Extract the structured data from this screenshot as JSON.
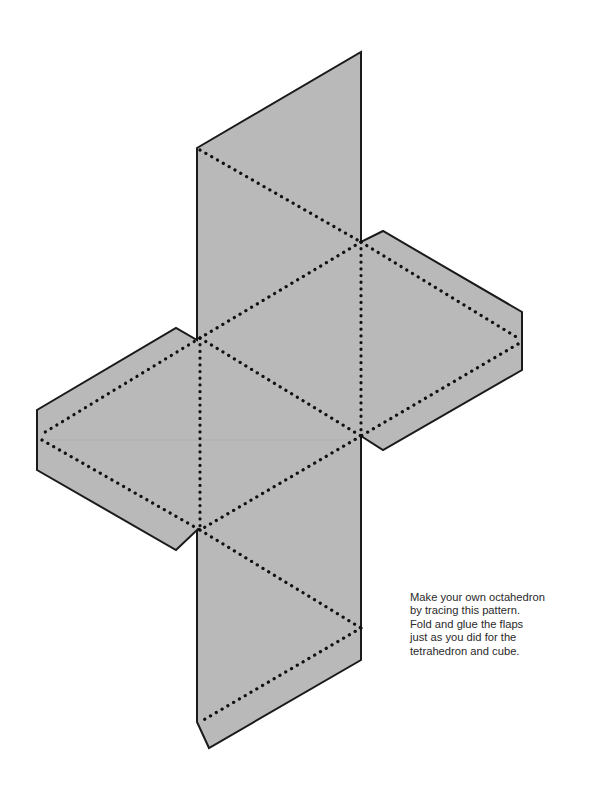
{
  "diagram": {
    "fill_color": "#b8b8b8",
    "outline_color": "#1a1a1a",
    "fold_line_style": "dotted",
    "faces": 8,
    "flaps": 4
  },
  "caption": {
    "lines": [
      "Make your own octahedron",
      "by tracing this pattern.",
      "Fold and glue the flaps",
      "just as you did for the",
      "tetrahedron and cube."
    ]
  }
}
